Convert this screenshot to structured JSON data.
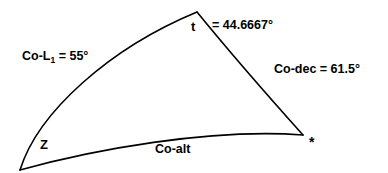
{
  "diagram": {
    "type": "spherical-triangle",
    "background_color": "#ffffff",
    "stroke_color": "#000000",
    "vertices": [
      {
        "id": "apex",
        "label": "t",
        "name": "vertex-t",
        "x": 197,
        "y": 12
      },
      {
        "id": "zenith",
        "label": "Z",
        "name": "vertex-z",
        "x": 20,
        "y": 170
      },
      {
        "id": "star",
        "label": "*",
        "name": "vertex-star",
        "x": 303,
        "y": 135
      }
    ],
    "sides": [
      {
        "id": "left",
        "label": "Co-L",
        "subscript": "1",
        "equals": "=",
        "value": "55",
        "unit": "°",
        "full_text": "Co-L₁ = 55°"
      },
      {
        "id": "right",
        "label": "Co-dec",
        "equals": "=",
        "value": "61.5",
        "unit": "°",
        "full_text": "Co-dec = 61.5°"
      },
      {
        "id": "bottom",
        "label": "Co-alt",
        "full_text": "Co-alt"
      }
    ],
    "angles": [
      {
        "id": "t",
        "symbol": "t",
        "equals": "=",
        "value": "44.6667",
        "unit": "°",
        "value_text": "=  44.6667°"
      }
    ],
    "labels": {
      "co_l1_prefix": "Co-L",
      "co_l1_subscript": "1",
      "co_l1_suffix": " = 55°",
      "vertex_t": "t",
      "t_value": "=  44.6667°",
      "co_dec": "Co-dec = 61.5°",
      "vertex_z": "Z",
      "co_alt": "Co-alt",
      "star_marker": "*"
    }
  }
}
